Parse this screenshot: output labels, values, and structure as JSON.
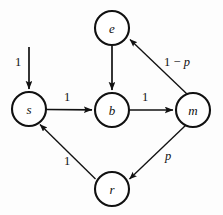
{
  "figure": {
    "kind": "state-transition-diagram",
    "background_color": "#fdfdfd",
    "stroke_color": "#111111",
    "width": 223,
    "height": 215
  },
  "nodes": [
    {
      "id": "e",
      "label": "e",
      "cx": 112,
      "cy": 28,
      "r": 17
    },
    {
      "id": "s",
      "label": "s",
      "cx": 29,
      "cy": 109,
      "r": 17
    },
    {
      "id": "b",
      "label": "b",
      "cx": 112,
      "cy": 110,
      "r": 17
    },
    {
      "id": "m",
      "label": "m",
      "cx": 193,
      "cy": 110,
      "r": 17
    },
    {
      "id": "r",
      "label": "r",
      "cx": 112,
      "cy": 189,
      "r": 17
    }
  ],
  "edges": [
    {
      "id": "entry-to-s",
      "from": "",
      "to": "s",
      "label": "1",
      "label_x": 18,
      "label_y": 62,
      "path": "M 29 47 L 29 90"
    },
    {
      "id": "s-to-b",
      "from": "s",
      "to": "b",
      "label": "1",
      "label_x": 67,
      "label_y": 97,
      "path": "M 47 109.5 L 93 109.8"
    },
    {
      "id": "b-to-m",
      "from": "b",
      "to": "m",
      "label": "1",
      "label_x": 145,
      "label_y": 97,
      "path": "M 130 110 L 174 110"
    },
    {
      "id": "e-to-b",
      "from": "e",
      "to": "b",
      "label": "",
      "label_x": 0,
      "label_y": 0,
      "path": "M 112 46 L 112 91"
    },
    {
      "id": "m-to-e",
      "from": "m",
      "to": "e",
      "label": "1 − p",
      "label_italic_part": "p",
      "label_x": 177,
      "label_y": 62,
      "path": "M 186.5 93.5 L 130.5 39"
    },
    {
      "id": "m-to-r",
      "from": "m",
      "to": "r",
      "label": "p",
      "label_italic": true,
      "label_x": 168,
      "label_y": 156,
      "path": "M 185.5 124.5 L 129 179.5"
    },
    {
      "id": "r-to-s",
      "from": "r",
      "to": "s",
      "label": "1",
      "label_x": 67,
      "label_y": 161,
      "path": "M 95 179.5 L 39 124"
    }
  ],
  "labels": {
    "entry_weight": "1",
    "s_to_b_weight": "1",
    "b_to_m_weight": "1",
    "r_to_s_weight": "1",
    "m_to_e_weight": "1 − p",
    "m_to_r_weight": "p"
  }
}
